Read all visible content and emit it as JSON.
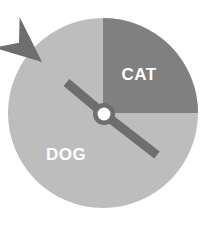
{
  "widget": {
    "name": "Spinner wheel",
    "background_color": "#ffffff"
  },
  "chart_data": {
    "type": "pie",
    "title": "",
    "subtitle": "",
    "xlabel": "",
    "ylabel": "",
    "grid": false,
    "legend_position": "inside-slices",
    "categories": [
      "CAT",
      "DOG"
    ],
    "values": [
      25,
      75
    ],
    "units": "percent",
    "slices": [
      {
        "label": "CAT",
        "value": 25,
        "start_angle_deg": 0,
        "end_angle_deg": 90,
        "color": "#808080",
        "label_color": "#ffffff",
        "label_x": 139,
        "label_y": 76
      },
      {
        "label": "DOG",
        "value": 75,
        "start_angle_deg": 90,
        "end_angle_deg": 360,
        "color": "#bdbdbd",
        "label_color": "#ffffff",
        "label_x": 66,
        "label_y": 156
      }
    ],
    "annotations": [
      {
        "name": "pointer-arrow",
        "kind": "arrow",
        "points_to_slice": "DOG",
        "angle_deg": 135,
        "color": "#6e6e6e",
        "tip_x": 42,
        "tip_y": 62,
        "tail_x": 157,
        "tail_y": 155
      },
      {
        "name": "center-hub",
        "kind": "pivot",
        "x": 104,
        "y": 114,
        "ring_color": "#6e6e6e",
        "dot_color": "#ffffff"
      }
    ],
    "circle": {
      "center_x": 103,
      "center_y": 113,
      "radius": 95
    }
  },
  "labels": {
    "cat": "CAT",
    "dog": "DOG"
  },
  "colors": {
    "dark_sector": "#808080",
    "light_sector": "#bdbdbd",
    "arrow": "#6e6e6e",
    "hub_ring": "#6e6e6e",
    "hub_dot": "#ffffff",
    "label_text": "#ffffff",
    "page_background": "#ffffff"
  }
}
